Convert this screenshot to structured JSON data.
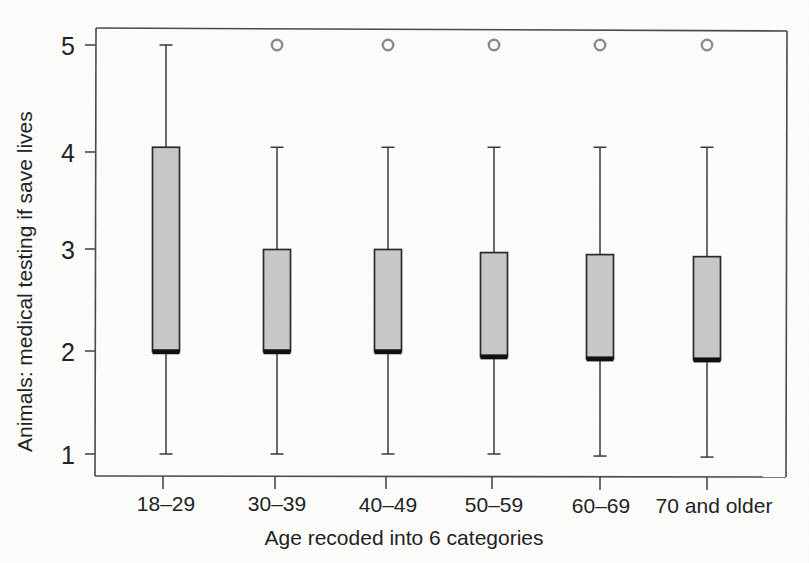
{
  "figure": {
    "kind": "scanned-statistical-figure",
    "background_color": "#fdfdfc",
    "box_fill_color": "#c9c9c9",
    "box_border_color": "#2b2b2b",
    "median_color": "#111111",
    "whisker_color": "#3a3a3a",
    "outlier_color": "#8c8c8c",
    "frame_color": "#4a4a4a"
  },
  "chart_data": {
    "type": "box",
    "title": "",
    "xlabel": "Age recoded into 6 categories",
    "ylabel": "Animals: medical testing if save lives",
    "categories": [
      "18–29",
      "30–39",
      "40–49",
      "50–59",
      "60–69",
      "70 and older"
    ],
    "ylim": [
      0.8,
      5.25
    ],
    "yticks": [
      1,
      2,
      3,
      4,
      5
    ],
    "ytick_labels": [
      "1",
      "2",
      "3",
      "4",
      "5"
    ],
    "grid": false,
    "legend": false,
    "boxes": [
      {
        "category": "18–29",
        "whisker_low": 1.0,
        "q1": 2.0,
        "median": 2.0,
        "q3": 4.0,
        "whisker_high": 5.0,
        "outliers": []
      },
      {
        "category": "30–39",
        "whisker_low": 1.0,
        "q1": 2.0,
        "median": 2.0,
        "q3": 3.0,
        "whisker_high": 4.0,
        "outliers": [
          5.0
        ]
      },
      {
        "category": "40–49",
        "whisker_low": 1.0,
        "q1": 2.0,
        "median": 2.0,
        "q3": 3.0,
        "whisker_high": 4.0,
        "outliers": [
          5.0
        ]
      },
      {
        "category": "50–59",
        "whisker_low": 1.0,
        "q1": 1.95,
        "median": 1.95,
        "q3": 2.97,
        "whisker_high": 4.0,
        "outliers": [
          5.0
        ]
      },
      {
        "category": "60–69",
        "whisker_low": 0.98,
        "q1": 1.93,
        "median": 1.93,
        "q3": 2.95,
        "whisker_high": 4.0,
        "outliers": [
          5.0
        ]
      },
      {
        "category": "70 and older",
        "whisker_low": 0.97,
        "q1": 1.92,
        "median": 1.92,
        "q3": 2.93,
        "whisker_high": 4.0,
        "outliers": [
          5.0
        ]
      }
    ]
  }
}
